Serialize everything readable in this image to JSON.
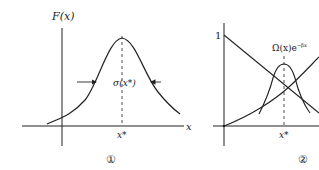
{
  "figures": [
    {
      "id": "fig1",
      "number_label": "①",
      "y_axis_label": "F(x)",
      "x_axis_label": "x",
      "peak_label": "x*",
      "width_label": "σ(x*)",
      "description": "Peaked function F(x) with maximum at x*, width σ(x*)"
    },
    {
      "id": "fig2",
      "number_label": "②",
      "y_tick_label": "1",
      "curve_label": "Ω(x)e",
      "curve_label_sup": "−βx",
      "peak_label": "x*",
      "description": "Decreasing and increasing curves whose product is peaked at x*"
    }
  ],
  "colors": {
    "ink": "#222222",
    "background": "#ffffff"
  }
}
